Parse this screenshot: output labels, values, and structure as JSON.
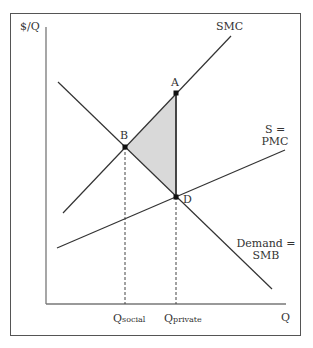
{
  "diagram": {
    "axes": {
      "y_label": "$/Q",
      "x_label": "Q"
    },
    "curves": {
      "smc": {
        "label": "SMC",
        "color": "#333333"
      },
      "pmc": {
        "label_line1": "S =",
        "label_line2": "PMC",
        "color": "#333333"
      },
      "demand": {
        "label_line1": "Demand =",
        "label_line2": "SMB",
        "color": "#333333"
      }
    },
    "points": {
      "a": {
        "label": "A"
      },
      "b": {
        "label": "B"
      },
      "d": {
        "label": "D"
      }
    },
    "quantities": {
      "q_social": {
        "main": "Q",
        "sub": "social"
      },
      "q_private": {
        "main": "Q",
        "sub": "private"
      }
    },
    "deadweight_loss": {
      "fill": "#d9d9d9",
      "vertices": [
        "A",
        "B",
        "D"
      ]
    }
  }
}
